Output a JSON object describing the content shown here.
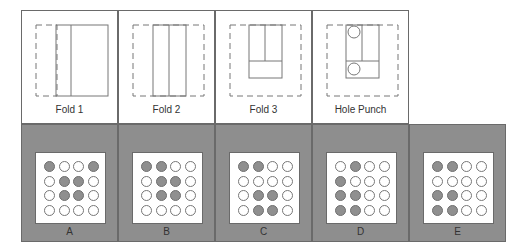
{
  "question": {
    "steps": [
      {
        "label": "Fold 1",
        "icon": "fold-1-diagram"
      },
      {
        "label": "Fold 2",
        "icon": "fold-2-diagram"
      },
      {
        "label": "Fold 3",
        "icon": "fold-3-diagram"
      },
      {
        "label": "Hole Punch",
        "icon": "hole-punch-diagram"
      }
    ]
  },
  "options": [
    {
      "label": "A",
      "grid": [
        [
          1,
          0,
          0,
          1
        ],
        [
          0,
          1,
          1,
          0
        ],
        [
          0,
          1,
          1,
          0
        ],
        [
          0,
          0,
          0,
          0
        ]
      ]
    },
    {
      "label": "B",
      "grid": [
        [
          1,
          1,
          0,
          0
        ],
        [
          0,
          1,
          1,
          0
        ],
        [
          0,
          1,
          1,
          0
        ],
        [
          0,
          0,
          0,
          0
        ]
      ]
    },
    {
      "label": "C",
      "grid": [
        [
          1,
          1,
          0,
          0
        ],
        [
          0,
          0,
          0,
          0
        ],
        [
          0,
          1,
          1,
          0
        ],
        [
          0,
          1,
          1,
          0
        ]
      ]
    },
    {
      "label": "D",
      "grid": [
        [
          0,
          1,
          0,
          0
        ],
        [
          1,
          0,
          0,
          0
        ],
        [
          1,
          1,
          0,
          0
        ],
        [
          1,
          1,
          0,
          0
        ]
      ]
    },
    {
      "label": "E",
      "grid": [
        [
          1,
          1,
          0,
          0
        ],
        [
          0,
          0,
          0,
          0
        ],
        [
          1,
          1,
          0,
          0
        ],
        [
          1,
          1,
          0,
          0
        ]
      ]
    }
  ],
  "colors": {
    "panel_bg": "#8e8e8e",
    "filled_hole": "#8f8f8f",
    "border": "#6a6a6a"
  }
}
